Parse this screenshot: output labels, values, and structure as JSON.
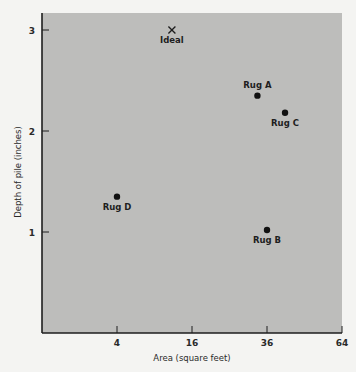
{
  "chart_data": {
    "type": "scatter",
    "title": "",
    "xlabel": "Area (square feet)",
    "ylabel": "Depth of pile (inches)",
    "x_scale": "sqrt",
    "xlim": [
      0,
      64
    ],
    "ylim": [
      0,
      3.2
    ],
    "x_ticks": [
      4,
      16,
      36,
      64
    ],
    "y_ticks": [
      1,
      2,
      3
    ],
    "grid": false,
    "legend": null,
    "points": [
      {
        "label": "Ideal",
        "x": 12,
        "y": 3.0,
        "marker": "x",
        "label_pos": "below"
      },
      {
        "label": "Rug A",
        "x": 33,
        "y": 2.35,
        "marker": "dot",
        "label_pos": "above"
      },
      {
        "label": "Rug C",
        "x": 42,
        "y": 2.18,
        "marker": "dot",
        "label_pos": "below"
      },
      {
        "label": "Rug D",
        "x": 4,
        "y": 1.35,
        "marker": "dot",
        "label_pos": "below"
      },
      {
        "label": "Rug B",
        "x": 36,
        "y": 1.02,
        "marker": "dot",
        "label_pos": "below"
      }
    ],
    "colors": {
      "plot_bg": "#bdbdbb",
      "page_bg": "#f4f4f2",
      "ink": "#1e1e1e"
    }
  }
}
